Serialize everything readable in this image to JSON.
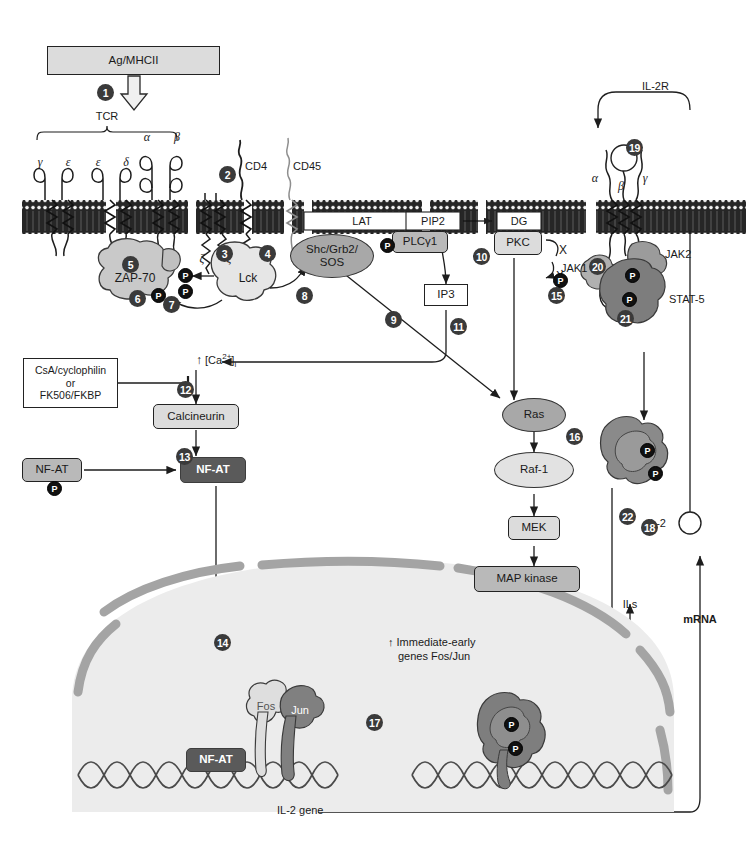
{
  "figure": {
    "page_header": "",
    "domain": "Diagram"
  },
  "colors": {
    "membrane_dark": "#2b2b2b",
    "protein_mid": "#a8a8a8",
    "protein_light": "#e2e2e2",
    "protein_dark": "#5a5a5a",
    "nucleus_fill": "#eceaea",
    "nuclear_envelope": "#a9a9a9",
    "step_bullet": "#3a3a3a",
    "phosphate": "#111111"
  },
  "top": {
    "ligand_box": "Ag/MHCII",
    "tcr_bracket": "TCR",
    "chains": [
      "γ",
      "ε",
      "ε",
      "δ",
      "α",
      "β",
      "ζ",
      "ζ"
    ],
    "cd4": "CD4",
    "cd45": "CD45"
  },
  "membrane_labels": {
    "lat": "LAT",
    "pip2": "PIP2",
    "dg": "DG"
  },
  "cytoplasm": {
    "zap70": "ZAP-70",
    "lck": "Lck",
    "shc_grb2_sos": "Shc/Grb2/\nSOS",
    "shc_grb2_sos_line1": "Shc/Grb2/",
    "shc_grb2_sos_line2": "SOS",
    "plcg1": "PLCγ1",
    "ip3": "IP3",
    "pkc": "PKC",
    "substrate_x": "X",
    "substrate_x_phos": "X",
    "calcium": "↑ [Ca2+]i",
    "calcium_main": "[Ca",
    "inhibitor_box_line1": "CsA/cyclophilin",
    "inhibitor_box_line2": "or",
    "inhibitor_box_line3": "FK506/FKBP",
    "calcineurin": "Calcineurin",
    "nfat_inactive": "NF-AT",
    "nfat_active": "NF-AT",
    "ras": "Ras",
    "raf1": "Raf-1",
    "mek": "MEK",
    "map_kinase": "MAP kinase"
  },
  "il2r": {
    "receptor_label": "IL-2R",
    "chains": [
      "α",
      "β",
      "γ"
    ],
    "jak1": "JAK1",
    "jak2": "JAK2",
    "stat5": "STAT-5",
    "il2_ligand": "IL-2"
  },
  "nucleus": {
    "immediate_early_line1": "↑ Immediate-early",
    "immediate_early_line2": "genes Fos/Jun",
    "fos": "Fos",
    "jun": "Jun",
    "nfat": "NF-AT",
    "il2_gene": "IL-2 gene",
    "ils": "ILs",
    "mrna": "mRNA"
  },
  "steps": [
    {
      "n": "1",
      "x": 97,
      "y": 84,
      "desc": "antigen-MHCII engages TCR"
    },
    {
      "n": "2",
      "x": 219,
      "y": 166,
      "desc": "CD4 co-receptor"
    },
    {
      "n": "3",
      "x": 216,
      "y": 245,
      "desc": "Lck activation"
    },
    {
      "n": "4",
      "x": 259,
      "y": 245,
      "desc": "CD45 phosphatase"
    },
    {
      "n": "5",
      "x": 122,
      "y": 256,
      "desc": "ZAP-70 recruitment"
    },
    {
      "n": "6",
      "x": 129,
      "y": 290,
      "desc": "ZAP-70 phosphorylation"
    },
    {
      "n": "7",
      "x": 163,
      "y": 296,
      "desc": "Lck phosphorylates ZAP-70"
    },
    {
      "n": "8",
      "x": 296,
      "y": 287,
      "desc": "Shc/Grb2/SOS recruitment"
    },
    {
      "n": "9",
      "x": 385,
      "y": 311,
      "desc": "Ras activation"
    },
    {
      "n": "10",
      "x": 473,
      "y": 248,
      "desc": "PIP2 hydrolysis"
    },
    {
      "n": "11",
      "x": 450,
      "y": 318,
      "desc": "IP3 raises calcium"
    },
    {
      "n": "12",
      "x": 177,
      "y": 381,
      "desc": "calcineurin inhibition"
    },
    {
      "n": "13",
      "x": 176,
      "y": 448,
      "desc": "NF-AT dephosphorylation"
    },
    {
      "n": "14",
      "x": 214,
      "y": 634,
      "desc": "NF-AT nuclear import"
    },
    {
      "n": "15",
      "x": 548,
      "y": 287,
      "desc": "PKC signaling"
    },
    {
      "n": "16",
      "x": 566,
      "y": 428,
      "desc": "Raf-1 activation"
    },
    {
      "n": "17",
      "x": 366,
      "y": 714,
      "desc": "Fos/Jun AP-1 assembly"
    },
    {
      "n": "18",
      "x": 641,
      "y": 519,
      "desc": "IL-2 secretion"
    },
    {
      "n": "19",
      "x": 626,
      "y": 139,
      "desc": "IL-2 binds IL-2R"
    },
    {
      "n": "20",
      "x": 589,
      "y": 258,
      "desc": "JAK activation"
    },
    {
      "n": "21",
      "x": 617,
      "y": 310,
      "desc": "STAT-5 phosphorylation"
    },
    {
      "n": "22",
      "x": 619,
      "y": 508,
      "desc": "STAT-5 dimer nuclear import"
    }
  ],
  "phosphates": [
    {
      "label": "P",
      "x": 178,
      "y": 268,
      "where": "zeta-ITAM-upper"
    },
    {
      "label": "P",
      "x": 178,
      "y": 284,
      "where": "zeta-ITAM-lower"
    },
    {
      "label": "P",
      "x": 151,
      "y": 288,
      "where": "zap70"
    },
    {
      "label": "P",
      "x": 380,
      "y": 238,
      "where": "plcgamma1"
    },
    {
      "label": "P",
      "x": 553,
      "y": 273,
      "where": "pkc-substrate"
    },
    {
      "label": "P",
      "x": 625,
      "y": 268,
      "where": "stat5-upper"
    },
    {
      "label": "P",
      "x": 622,
      "y": 292,
      "where": "stat5-lower"
    },
    {
      "label": "P",
      "x": 640,
      "y": 443,
      "where": "stat5-dimer-upper"
    },
    {
      "label": "P",
      "x": 648,
      "y": 466,
      "where": "stat5-dimer-lower"
    },
    {
      "label": "P",
      "x": 47,
      "y": 481,
      "where": "nfat-inactive"
    },
    {
      "label": "P",
      "x": 504,
      "y": 717,
      "where": "nuclear-stat-upper"
    },
    {
      "label": "P",
      "x": 508,
      "y": 741,
      "where": "nuclear-stat-lower"
    }
  ]
}
